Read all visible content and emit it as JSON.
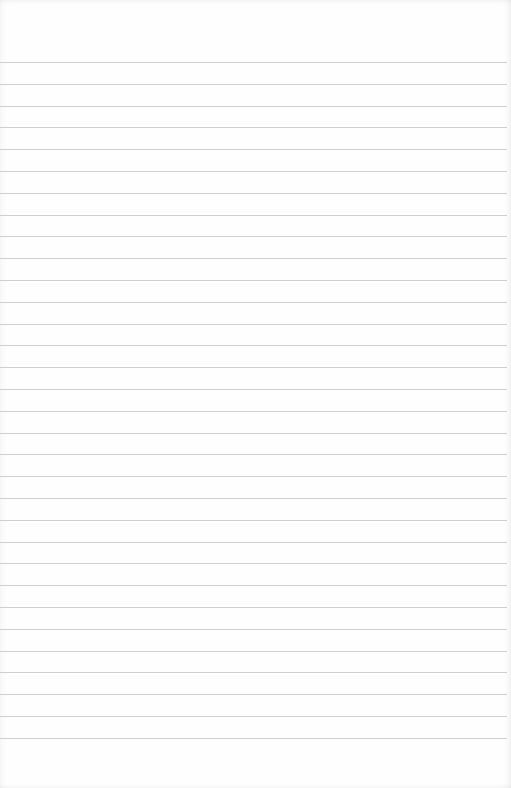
{
  "page": {
    "type": "lined-paper",
    "background_color": "#fefefe",
    "line_color": "#cfcfcf",
    "first_line_y": 62,
    "line_spacing": 21.8,
    "line_count": 32,
    "text_content": ""
  }
}
